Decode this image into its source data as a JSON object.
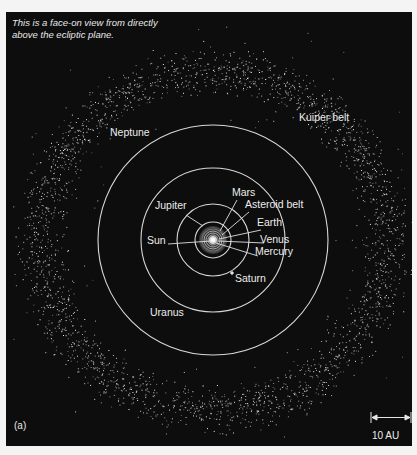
{
  "caption": {
    "line1": "This is a face-on view from directly",
    "line2": "above the ecliptic plane."
  },
  "panel_label": "(a)",
  "scale_bar": {
    "label": "10 AU",
    "length_px": 40
  },
  "center": {
    "x": 207,
    "y": 228
  },
  "orbits": [
    {
      "name": "Mercury",
      "radius": 3
    },
    {
      "name": "Venus",
      "radius": 5
    },
    {
      "name": "Earth",
      "radius": 7
    },
    {
      "name": "Mars",
      "radius": 9
    },
    {
      "name": "Jupiter",
      "radius": 18
    },
    {
      "name": "Saturn",
      "radius": 36
    },
    {
      "name": "Uranus",
      "radius": 72
    },
    {
      "name": "Neptune",
      "radius": 115
    }
  ],
  "kuiper_belt": {
    "inner_radius": 140,
    "outer_radius": 200,
    "peak_radius": 170
  },
  "labels": {
    "sun": "Sun",
    "mercury": "Mercury",
    "venus": "Venus",
    "earth": "Earth",
    "mars": "Mars",
    "asteroid_belt": "Asteroid belt",
    "jupiter": "Jupiter",
    "saturn": "Saturn",
    "uranus": "Uranus",
    "neptune": "Neptune",
    "kuiper_belt": "Kuiper belt"
  },
  "colors": {
    "background": "#0d0d0d",
    "page": "#f4f4f4",
    "orbit": "#d8d8d8",
    "text": "#ececec"
  }
}
